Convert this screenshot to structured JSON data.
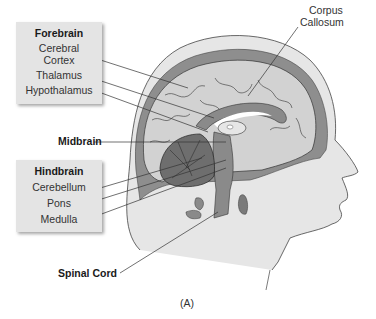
{
  "diagram": {
    "caption": "(A)",
    "forebrain": {
      "title": "Forebrain",
      "items": [
        "Cerebral Cortex",
        "Thalamus",
        "Hypothalamus"
      ],
      "cerebral_line1": "Cerebral",
      "cerebral_line2": "Cortex"
    },
    "hindbrain": {
      "title": "Hindbrain",
      "items": [
        "Cerebellum",
        "Pons",
        "Medulla"
      ]
    },
    "labels": {
      "midbrain": "Midbrain",
      "spinal_cord": "Spinal Cord",
      "corpus_line1": "Corpus",
      "corpus_line2": "Callosum"
    },
    "colors": {
      "box_fill": "#e4e4e4",
      "brain_fill": "#cfcfcf",
      "dark_gray": "#8a8a8a",
      "skin": "#e2e2e2"
    }
  }
}
